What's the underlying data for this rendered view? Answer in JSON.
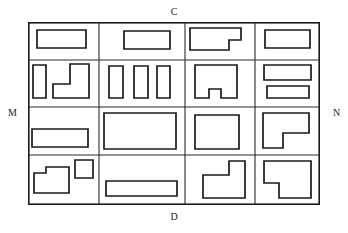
{
  "figure": {
    "type": "floor-plan-grid-diagram",
    "title": "",
    "grid": {
      "rows": 4,
      "columns": 4
    },
    "labels": {
      "top": "C",
      "bottom": "D",
      "left": "M",
      "right": "N"
    },
    "colors": {
      "background": "#ffffff",
      "outline": "#1a1a1a",
      "grid_line": "#2a2a2a",
      "fill": "#ffffff"
    },
    "frame": {
      "x": 28,
      "y": 22,
      "width": 292,
      "height": 183
    },
    "column_edges": [
      0,
      71,
      157,
      227,
      292
    ],
    "row_edges": [
      0,
      38,
      85,
      133,
      183
    ],
    "cells": [
      {
        "id": "r1c1",
        "row": 1,
        "column": 1,
        "shape_count": 1,
        "shapes": [
          {
            "name": "rectangle",
            "points": "9,8 58,8 58,26 9,26"
          }
        ]
      },
      {
        "id": "r1c2",
        "row": 1,
        "column": 2,
        "shape_count": 1,
        "shapes": [
          {
            "name": "rectangle",
            "points": "25,9 71,9 71,27 25,27"
          }
        ]
      },
      {
        "id": "r1c3",
        "row": 1,
        "column": 3,
        "shape_count": 1,
        "shapes": [
          {
            "name": "l-shape-step-down-right",
            "points": "5,6 56,6 56,18 44,18 44,28 5,28"
          }
        ]
      },
      {
        "id": "r1c4",
        "row": 1,
        "column": 4,
        "shape_count": 1,
        "shapes": [
          {
            "name": "rectangle",
            "points": "10,8 55,8 55,26 10,26"
          }
        ]
      },
      {
        "id": "r2c1",
        "row": 2,
        "column": 1,
        "shape_count": 2,
        "shapes": [
          {
            "name": "vertical-rectangle",
            "points": "5,5 18,5 18,38 5,38"
          },
          {
            "name": "l-shape-boot",
            "points": "42,4 61,4 61,38 25,38 25,24 42,24"
          }
        ]
      },
      {
        "id": "r2c2",
        "row": 2,
        "column": 2,
        "shape_count": 3,
        "shapes": [
          {
            "name": "vertical-rectangle",
            "points": "10,6 24,6 24,38 10,38"
          },
          {
            "name": "vertical-rectangle",
            "points": "35,6 49,6 49,38 35,38"
          },
          {
            "name": "vertical-rectangle",
            "points": "58,6 71,6 71,38 58,38"
          }
        ]
      },
      {
        "id": "r2c3",
        "row": 2,
        "column": 3,
        "shape_count": 1,
        "shapes": [
          {
            "name": "rectangle-with-bottom-notch",
            "points": "10,5 52,5 52,38 36,38 36,29 24,29 24,38 10,38"
          }
        ]
      },
      {
        "id": "r2c4",
        "row": 2,
        "column": 4,
        "shape_count": 2,
        "shapes": [
          {
            "name": "horizontal-rectangle",
            "points": "9,5 56,5 56,20 9,20"
          },
          {
            "name": "horizontal-rectangle",
            "points": "12,26 54,26 54,38 12,38"
          }
        ]
      },
      {
        "id": "r3c1",
        "row": 3,
        "column": 1,
        "shape_count": 1,
        "shapes": [
          {
            "name": "horizontal-rectangle",
            "points": "4,22 60,22 60,40 4,40"
          }
        ]
      },
      {
        "id": "r3c2",
        "row": 3,
        "column": 2,
        "shape_count": 1,
        "shapes": [
          {
            "name": "large-rectangle",
            "points": "5,6 77,6 77,42 5,42"
          }
        ]
      },
      {
        "id": "r3c3",
        "row": 3,
        "column": 3,
        "shape_count": 1,
        "shapes": [
          {
            "name": "rectangle",
            "points": "10,8 54,8 54,42 10,42"
          }
        ]
      },
      {
        "id": "r3c4",
        "row": 3,
        "column": 4,
        "shape_count": 1,
        "shapes": [
          {
            "name": "l-shape-notch-bottom-right",
            "points": "8,6 54,6 54,26 28,26 28,41 8,41"
          }
        ]
      },
      {
        "id": "r4c1",
        "row": 4,
        "column": 1,
        "shape_count": 2,
        "shapes": [
          {
            "name": "l-shape-notch-top-left",
            "points": "6,18 18,18 18,12 41,12 41,38 6,38"
          },
          {
            "name": "small-square",
            "points": "47,5 65,5 65,23 47,23"
          }
        ]
      },
      {
        "id": "r4c2",
        "row": 4,
        "column": 2,
        "shape_count": 1,
        "shapes": [
          {
            "name": "wide-flat-rectangle",
            "points": "7,26 78,26 78,41 7,41"
          }
        ]
      },
      {
        "id": "r4c3",
        "row": 4,
        "column": 3,
        "shape_count": 1,
        "shapes": [
          {
            "name": "step-shape-raised-right",
            "points": "18,20 44,20 44,6 60,6 60,43 18,43"
          }
        ]
      },
      {
        "id": "r4c4",
        "row": 4,
        "column": 4,
        "shape_count": 1,
        "shapes": [
          {
            "name": "step-shape-notch-bottom-left",
            "points": "9,6 56,6 56,43 24,43 24,28 9,28"
          }
        ]
      }
    ]
  }
}
